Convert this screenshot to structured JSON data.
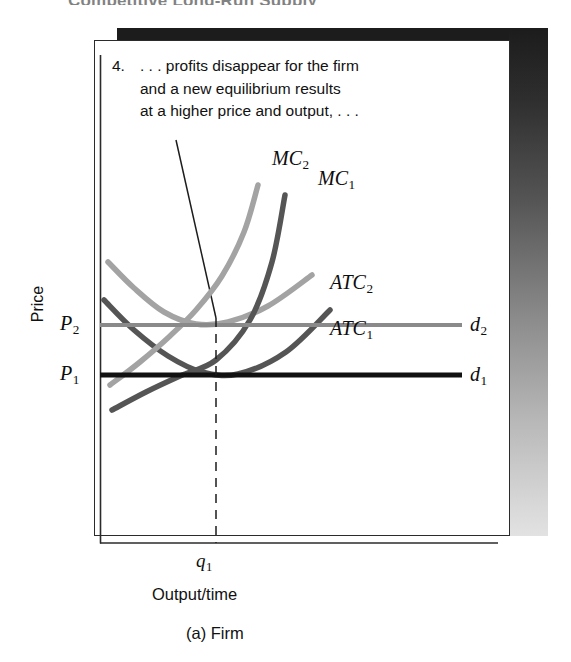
{
  "figure": {
    "caption": "(a) Firm",
    "scan_header_partial": "Competitive Long-Run Supply",
    "annotation": {
      "number": "4.",
      "lines": [
        ". . . profits disappear for the firm",
        "and a new equilibrium results",
        "at a higher price and output, . . ."
      ]
    },
    "axes": {
      "y_label": "Price",
      "x_label": "Output/time",
      "x_tick_label": "q",
      "x_tick_sub": "1"
    },
    "price_markers": [
      {
        "name": "P",
        "sub": "2",
        "color": "#8a8a8a"
      },
      {
        "name": "P",
        "sub": "1",
        "color": "#111111"
      }
    ],
    "curve_labels": [
      {
        "name": "MC",
        "sub": "2",
        "color": "#a3a3a3"
      },
      {
        "name": "MC",
        "sub": "1",
        "color": "#555555"
      },
      {
        "name": "ATC",
        "sub": "2",
        "color": "#a3a3a3"
      },
      {
        "name": "ATC",
        "sub": "1",
        "color": "#555555"
      },
      {
        "name": "d",
        "sub": "2",
        "color": "#8a8a8a"
      },
      {
        "name": "d",
        "sub": "1",
        "color": "#111111"
      }
    ],
    "colors": {
      "curve_light": "#a3a3a3",
      "curve_dark": "#555555",
      "demand_2": "#8a8a8a",
      "demand_1": "#111111",
      "axis": "#2b2b2b",
      "panel": "#ffffff",
      "shadow_dark": "#1c1c1c"
    }
  },
  "chart_data": {
    "type": "line",
    "title": "(a) Firm",
    "xlabel": "Output/time",
    "ylabel": "Price",
    "grid": false,
    "legend": "inline-curve-labels",
    "axis_origin_px": [
      100,
      543
    ],
    "annotations": [
      {
        "text": "4. . . . profits disappear for the firm and a new equilibrium results at a higher price and output, . . .",
        "leader_from_px": [
          176,
          140
        ],
        "leader_to_px": [
          216,
          318
        ]
      }
    ],
    "reference_lines": [
      {
        "name": "d2",
        "label": "d₂",
        "orientation": "horizontal",
        "y_px": 325,
        "price_label": "P₂",
        "color": "#8a8a8a",
        "width": 4
      },
      {
        "name": "d1",
        "label": "d₁",
        "orientation": "horizontal",
        "y_px": 375,
        "price_label": "P₁",
        "color": "#111111",
        "width": 5
      },
      {
        "name": "q1",
        "label": "q₁",
        "orientation": "vertical",
        "x_px": 216,
        "style": "dashed",
        "color": "#1d1d1d"
      }
    ],
    "series": [
      {
        "name": "MC₂",
        "color": "#a3a3a3",
        "role": "marginal-cost-after",
        "points_px": [
          [
            110,
            385
          ],
          [
            140,
            362
          ],
          [
            170,
            336
          ],
          [
            196,
            310
          ],
          [
            222,
            276
          ],
          [
            244,
            232
          ],
          [
            258,
            185
          ]
        ]
      },
      {
        "name": "MC₁",
        "color": "#555555",
        "role": "marginal-cost-before",
        "points_px": [
          [
            112,
            410
          ],
          [
            146,
            392
          ],
          [
            180,
            376
          ],
          [
            216,
            360
          ],
          [
            250,
            320
          ],
          [
            272,
            262
          ],
          [
            285,
            195
          ]
        ]
      },
      {
        "name": "ATC₂",
        "color": "#a3a3a3",
        "role": "average-total-cost-after",
        "points_px": [
          [
            108,
            262
          ],
          [
            134,
            288
          ],
          [
            164,
            312
          ],
          [
            196,
            324
          ],
          [
            228,
            322
          ],
          [
            268,
            306
          ],
          [
            312,
            275
          ]
        ]
      },
      {
        "name": "ATC₁",
        "color": "#555555",
        "role": "average-total-cost-before",
        "points_px": [
          [
            104,
            300
          ],
          [
            134,
            330
          ],
          [
            168,
            356
          ],
          [
            202,
            372
          ],
          [
            238,
            374
          ],
          [
            286,
            352
          ],
          [
            330,
            310
          ]
        ]
      }
    ],
    "equilibria": [
      {
        "label": "initial",
        "x_px": 216,
        "y_px": 375,
        "price": "P₁",
        "quantity": "q₁"
      },
      {
        "label": "new",
        "x_px": 216,
        "y_px": 325,
        "price": "P₂",
        "quantity": "q₁"
      }
    ]
  }
}
